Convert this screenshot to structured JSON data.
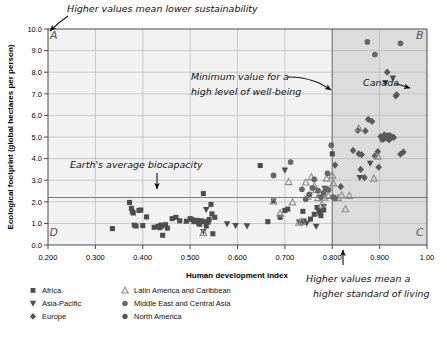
{
  "chart_data": {
    "type": "scatter",
    "title": "",
    "xlabel": "Human development index",
    "ylabel": "Ecological footprint (global hectares per person)",
    "xlim": [
      0.2,
      1.0
    ],
    "ylim": [
      0.0,
      10.0
    ],
    "xticks": [
      "0.200",
      "0.300",
      "0.400",
      "0.500",
      "0.600",
      "0.700",
      "0.800",
      "0.900",
      "1.00"
    ],
    "xtick_values": [
      0.2,
      0.3,
      0.4,
      0.5,
      0.6,
      0.7,
      0.8,
      0.9,
      1.0
    ],
    "yticks": [
      "0.0",
      "1.0",
      "2.0",
      "3.0",
      "4.0",
      "5.0",
      "6.0",
      "7.0",
      "8.0",
      "9.0",
      "10.0"
    ],
    "ytick_values": [
      0,
      1,
      2,
      3,
      4,
      5,
      6,
      7,
      8,
      9,
      10
    ],
    "grid": true,
    "legend_position": "below-axes",
    "reference_lines": [
      {
        "name": "earth-average-biocapacity",
        "orientation": "horizontal",
        "value": 2.2,
        "label": "Earth's average biocapacity"
      },
      {
        "name": "minimum-hdi-well-being",
        "orientation": "vertical",
        "value": 0.8,
        "label": "Minimum value for a high level of well-being"
      }
    ],
    "shaded_region": {
      "x_from": 0.8,
      "x_to": 1.0,
      "y_from": 0.0,
      "y_to": 10.0
    },
    "quadrant_labels": [
      {
        "name": "A",
        "x": 0.212,
        "y": 9.55
      },
      {
        "name": "B",
        "x": 0.985,
        "y": 9.55
      },
      {
        "name": "C",
        "x": 0.985,
        "y": 0.42
      },
      {
        "name": "D",
        "x": 0.212,
        "y": 0.42
      }
    ],
    "series": [
      {
        "name": "Africa",
        "marker": "square",
        "color": "#4d4d4d",
        "points": [
          [
            0.336,
            0.76
          ],
          [
            0.372,
            1.97
          ],
          [
            0.376,
            1.7
          ],
          [
            0.378,
            1.55
          ],
          [
            0.38,
            1.48
          ],
          [
            0.382,
            0.92
          ],
          [
            0.386,
            0.88
          ],
          [
            0.392,
            1.6
          ],
          [
            0.396,
            1.62
          ],
          [
            0.4,
            0.9
          ],
          [
            0.408,
            1.3
          ],
          [
            0.424,
            0.82
          ],
          [
            0.432,
            0.86
          ],
          [
            0.436,
            0.8
          ],
          [
            0.438,
            0.92
          ],
          [
            0.44,
            0.88
          ],
          [
            0.442,
            0.45
          ],
          [
            0.448,
            0.94
          ],
          [
            0.452,
            0.78
          ],
          [
            0.462,
            1.22
          ],
          [
            0.47,
            1.28
          ],
          [
            0.478,
            1.12
          ],
          [
            0.492,
            1.1
          ],
          [
            0.5,
            1.22
          ],
          [
            0.504,
            1.18
          ],
          [
            0.508,
            1.08
          ],
          [
            0.514,
            1.14
          ],
          [
            0.518,
            1.02
          ],
          [
            0.52,
            0.96
          ],
          [
            0.524,
            1.12
          ],
          [
            0.528,
            2.38
          ],
          [
            0.53,
            1.08
          ],
          [
            0.534,
            0.88
          ],
          [
            0.538,
            1.06
          ],
          [
            0.54,
            1.18
          ],
          [
            0.544,
            1.88
          ],
          [
            0.546,
            1.44
          ],
          [
            0.548,
            0.52
          ],
          [
            0.552,
            1.28
          ],
          [
            0.648,
            3.68
          ],
          [
            0.664,
            1.08
          ],
          [
            0.676,
            2.04
          ],
          [
            0.69,
            1.28
          ],
          [
            0.7,
            1.6
          ],
          [
            0.706,
            1.66
          ],
          [
            0.738,
            1.56
          ],
          [
            0.754,
            1.2
          ],
          [
            0.762,
            1.42
          ],
          [
            0.768,
            1.74
          ],
          [
            0.772,
            1.58
          ],
          [
            0.774,
            1.46
          ],
          [
            0.776,
            1.36
          ],
          [
            0.782,
            1.62
          ],
          [
            0.8,
            4.22
          ]
        ]
      },
      {
        "name": "Asia-Pacific",
        "marker": "triangle-down",
        "color": "#4d4d4d",
        "points": [
          [
            0.528,
            0.62
          ],
          [
            0.534,
            1.64
          ],
          [
            0.578,
            0.98
          ],
          [
            0.596,
            0.9
          ],
          [
            0.62,
            0.88
          ],
          [
            0.7,
            3.46
          ],
          [
            0.73,
            1.06
          ],
          [
            0.736,
            1.02
          ],
          [
            0.74,
            1.1
          ],
          [
            0.746,
            1.0
          ],
          [
            0.766,
            0.86
          ],
          [
            0.782,
            1.78
          ],
          [
            0.784,
            2.62
          ],
          [
            0.88,
            3.78
          ],
          [
            0.912,
            7.52
          ],
          [
            0.928,
            7.72
          ],
          [
            0.858,
            3.12
          ]
        ]
      },
      {
        "name": "Europe",
        "marker": "diamond",
        "color": "#595959",
        "points": [
          [
            0.806,
            3.7
          ],
          [
            0.818,
            2.7
          ],
          [
            0.844,
            4.38
          ],
          [
            0.856,
            4.22
          ],
          [
            0.86,
            3.5
          ],
          [
            0.862,
            4.18
          ],
          [
            0.868,
            3.12
          ],
          [
            0.87,
            5.28
          ],
          [
            0.876,
            5.82
          ],
          [
            0.884,
            5.72
          ],
          [
            0.89,
            4.12
          ],
          [
            0.896,
            4.32
          ],
          [
            0.898,
            3.6
          ],
          [
            0.902,
            5.02
          ],
          [
            0.906,
            4.96
          ],
          [
            0.91,
            5.1
          ],
          [
            0.914,
            5.04
          ],
          [
            0.916,
            8.0
          ],
          [
            0.918,
            4.92
          ],
          [
            0.92,
            4.86
          ],
          [
            0.922,
            5.06
          ],
          [
            0.926,
            5.0
          ],
          [
            0.93,
            4.98
          ],
          [
            0.934,
            6.9
          ],
          [
            0.936,
            6.96
          ],
          [
            0.854,
            5.3
          ],
          [
            0.944,
            4.2
          ],
          [
            0.95,
            4.3
          ]
        ]
      },
      {
        "name": "Latin America and Caribbean",
        "marker": "triangle-up",
        "color": "#8c8c8c",
        "points": [
          [
            0.528,
            0.56
          ],
          [
            0.676,
            2.02
          ],
          [
            0.69,
            1.46
          ],
          [
            0.708,
            2.92
          ],
          [
            0.716,
            1.98
          ],
          [
            0.73,
            1.04
          ],
          [
            0.736,
            1.08
          ],
          [
            0.744,
            2.9
          ],
          [
            0.748,
            2.24
          ],
          [
            0.756,
            3.14
          ],
          [
            0.762,
            2.72
          ],
          [
            0.766,
            2.56
          ],
          [
            0.77,
            2.18
          ],
          [
            0.774,
            2.36
          ],
          [
            0.778,
            1.88
          ],
          [
            0.784,
            2.2
          ],
          [
            0.788,
            3.08
          ],
          [
            0.792,
            2.28
          ],
          [
            0.8,
            3.22
          ],
          [
            0.812,
            2.18
          ],
          [
            0.82,
            2.3
          ],
          [
            0.828,
            1.66
          ],
          [
            0.836,
            2.28
          ],
          [
            0.856,
            5.4
          ],
          [
            0.888,
            3.08
          ],
          [
            0.896,
            4.1
          ],
          [
            0.802,
            2.86
          ]
        ]
      },
      {
        "name": "Middle East and Central Asia",
        "marker": "circle",
        "color": "#666666",
        "points": [
          [
            0.676,
            3.22
          ],
          [
            0.712,
            3.84
          ],
          [
            0.736,
            2.58
          ],
          [
            0.744,
            2.12
          ],
          [
            0.752,
            2.34
          ],
          [
            0.758,
            2.64
          ],
          [
            0.762,
            3.04
          ],
          [
            0.77,
            2.52
          ],
          [
            0.776,
            2.22
          ],
          [
            0.782,
            2.42
          ],
          [
            0.786,
            2.58
          ],
          [
            0.79,
            3.32
          ],
          [
            0.792,
            2.56
          ],
          [
            0.798,
            4.62
          ],
          [
            0.802,
            2.22
          ],
          [
            0.806,
            2.16
          ],
          [
            0.874,
            9.4
          ],
          [
            0.89,
            8.82
          ],
          [
            0.944,
            9.34
          ]
        ]
      },
      {
        "name": "North America",
        "marker": "circle",
        "color": "#595959",
        "points": [
          [
            0.906,
            4.88
          ],
          [
            0.912,
            4.94
          ],
          [
            0.918,
            5.08
          ],
          [
            0.924,
            4.98
          ]
        ]
      }
    ]
  },
  "annotations": {
    "top": "Higher values mean lower sustainability",
    "minimum_line": [
      "Minimum value for a",
      "high level of well-being"
    ],
    "biocapacity": "Earth's average biocapacity",
    "canada": "Canada",
    "bottom_right": [
      "Higher values mean a",
      "higher standard of living"
    ]
  },
  "legend": {
    "items": [
      {
        "label": "Africa",
        "marker": "square"
      },
      {
        "label": "Latin America and Caribbean",
        "marker": "triangle-up"
      },
      {
        "label": "Asia-Pacific",
        "marker": "triangle-down"
      },
      {
        "label": "Middle East and Central Asia",
        "marker": "circle"
      },
      {
        "label": "Europe",
        "marker": "diamond"
      },
      {
        "label": "North America",
        "marker": "circle"
      }
    ]
  },
  "colors": {
    "plot_background": "#f2f2f2",
    "shaded_region": "#dcdcdc",
    "grid": "#b8b8b8",
    "axis": "#4a4a4a",
    "annotation_text": "#111111",
    "quadrant_text": "#6b6b6b"
  }
}
